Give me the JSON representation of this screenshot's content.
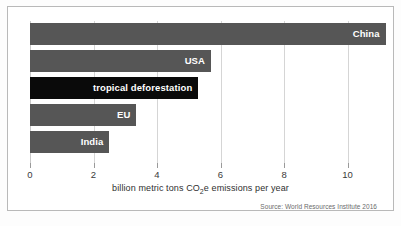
{
  "chart_data": {
    "type": "bar",
    "orientation": "horizontal",
    "title": "",
    "subtitle": "",
    "xlabel_prefix": "billion metric tons CO",
    "xlabel_sub": "2",
    "xlabel_suffix": "e emissions per year",
    "xlabel": "billion metric tons CO2e emissions per year",
    "ylabel": "",
    "categories": [
      "China",
      "USA",
      "tropical deforestation",
      "EU",
      "India"
    ],
    "values": [
      11.2,
      5.7,
      5.3,
      3.35,
      2.5
    ],
    "bar_colors": [
      "#565656",
      "#565656",
      "#0a0a0a",
      "#565656",
      "#565656"
    ],
    "highlighted_category": "tropical deforestation",
    "xlim": [
      0,
      11.4
    ],
    "ticks": [
      0,
      2,
      4,
      6,
      8,
      10
    ],
    "tick_labels": [
      "0",
      "2",
      "4",
      "6",
      "8",
      "10"
    ],
    "grid": true,
    "grid_axis": "x",
    "legend": false,
    "source": "Source: World Resources Institute 2016",
    "accent_color": "#565656",
    "highlight_color": "#0a0a0a",
    "grid_color": "#d5d5d5",
    "background_color": "#ffffff"
  }
}
